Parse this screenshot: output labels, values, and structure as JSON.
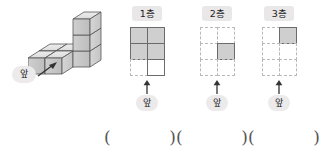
{
  "figure": {
    "name": "cube-solid-l-shape",
    "front_label": "앞",
    "description_cubes": 6
  },
  "layers": [
    {
      "label": "1층",
      "front_label": "앞",
      "grid": {
        "cols": 2,
        "rows": 3,
        "cells": [
          [
            "filled",
            "filled"
          ],
          [
            "filled",
            "filled"
          ],
          [
            "empty",
            "outline"
          ]
        ]
      }
    },
    {
      "label": "2층",
      "front_label": "앞",
      "grid": {
        "cols": 2,
        "rows": 3,
        "cells": [
          [
            "empty",
            "empty"
          ],
          [
            "empty",
            "filled"
          ],
          [
            "empty",
            "empty"
          ]
        ]
      }
    },
    {
      "label": "3층",
      "front_label": "앞",
      "grid": {
        "cols": 2,
        "rows": 3,
        "cells": [
          [
            "empty",
            "filled"
          ],
          [
            "empty",
            "empty"
          ],
          [
            "empty",
            "empty"
          ]
        ]
      }
    }
  ],
  "answers": {
    "open_paren": "(",
    "close_paren": ")",
    "blanks": [
      "",
      "",
      ""
    ]
  },
  "colors": {
    "fill_gray": "#cfcfcf",
    "stroke_dark": "#6b6b6b",
    "dash_gray": "#b9b9b9",
    "tag_bg": "#eceaea",
    "label_bg": "#e9e7e7"
  }
}
